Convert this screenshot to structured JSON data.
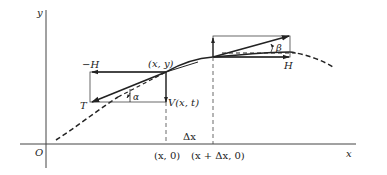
{
  "figure": {
    "type": "string element force diagram",
    "colors": {
      "ink": "#222222",
      "background": "#ffffff"
    }
  },
  "axes": {
    "y_label": "y",
    "x_label": "x",
    "origin_label": "O"
  },
  "points": {
    "left_point": "(x, y)",
    "left_foot": "(x, 0)",
    "right_foot": "(x + Δx, 0)",
    "interval": "Δx"
  },
  "forces": {
    "left_horizontal": "−H",
    "left_tension": "T",
    "left_vertical": "V(x, t)",
    "right_horizontal": "H"
  },
  "angles": {
    "left": "α",
    "right": "β"
  }
}
